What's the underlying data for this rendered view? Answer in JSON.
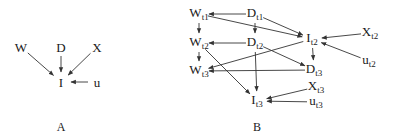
{
  "panels": {
    "A": {
      "caption": "A",
      "nodes": [
        {
          "id": "W",
          "base": "W",
          "sub": "",
          "x": 21,
          "y": 47
        },
        {
          "id": "D",
          "base": "D",
          "sub": "",
          "x": 61,
          "y": 47
        },
        {
          "id": "X",
          "base": "X",
          "sub": "",
          "x": 97,
          "y": 47
        },
        {
          "id": "I",
          "base": "I",
          "sub": "",
          "x": 61,
          "y": 82
        },
        {
          "id": "u",
          "base": "u",
          "sub": "",
          "x": 97,
          "y": 82
        }
      ],
      "edges": [
        [
          "W",
          "I"
        ],
        [
          "D",
          "I"
        ],
        [
          "X",
          "I"
        ],
        [
          "u",
          "I"
        ]
      ]
    },
    "B": {
      "caption": "B",
      "nodes": [
        {
          "id": "Wt1",
          "base": "W",
          "sub": "t1",
          "x": 199,
          "y": 14
        },
        {
          "id": "Dt1",
          "base": "D",
          "sub": "t1",
          "x": 255,
          "y": 14
        },
        {
          "id": "Wt2",
          "base": "W",
          "sub": "t2",
          "x": 199,
          "y": 43
        },
        {
          "id": "Dt2",
          "base": "D",
          "sub": "t2",
          "x": 255,
          "y": 43
        },
        {
          "id": "Wt3",
          "base": "W",
          "sub": "t3",
          "x": 199,
          "y": 71
        },
        {
          "id": "It2",
          "base": "I",
          "sub": "t2",
          "x": 312,
          "y": 39
        },
        {
          "id": "Xt2",
          "base": "X",
          "sub": "t2",
          "x": 370,
          "y": 33
        },
        {
          "id": "ut2",
          "base": "u",
          "sub": "t2",
          "x": 369,
          "y": 61
        },
        {
          "id": "Dt3",
          "base": "D",
          "sub": "t3",
          "x": 314,
          "y": 70
        },
        {
          "id": "Xt3",
          "base": "X",
          "sub": "t3",
          "x": 316,
          "y": 87
        },
        {
          "id": "It3",
          "base": "I",
          "sub": "t3",
          "x": 257,
          "y": 101
        },
        {
          "id": "ut3",
          "base": "u",
          "sub": "t3",
          "x": 316,
          "y": 102
        }
      ],
      "edges": [
        [
          "Dt1",
          "Wt1"
        ],
        [
          "Dt1",
          "Dt2"
        ],
        [
          "Dt1",
          "It2"
        ],
        [
          "Wt1",
          "Wt2"
        ],
        [
          "Wt1",
          "It2"
        ],
        [
          "Dt2",
          "Wt2"
        ],
        [
          "Dt2",
          "It3"
        ],
        [
          "Dt2",
          "Dt3"
        ],
        [
          "Wt2",
          "Wt3"
        ],
        [
          "Wt2",
          "It3"
        ],
        [
          "It2",
          "Wt3"
        ],
        [
          "It2",
          "Dt3"
        ],
        [
          "Xt2",
          "It2"
        ],
        [
          "ut2",
          "It2"
        ],
        [
          "Dt3",
          "Wt3"
        ],
        [
          "Xt3",
          "It3"
        ],
        [
          "ut3",
          "It3"
        ]
      ]
    }
  },
  "captions": {
    "A": "A",
    "B": "B"
  },
  "colors": {
    "line": "#333333",
    "text": "#1a1a1a"
  }
}
